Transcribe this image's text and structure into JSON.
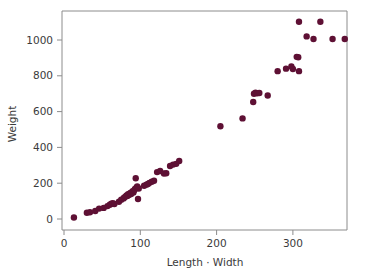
{
  "chart_data": {
    "type": "scatter",
    "title": "",
    "xlabel": "Length · Width",
    "ylabel": "Weight",
    "xlim": [
      0,
      375
    ],
    "ylim": [
      0,
      1130
    ],
    "xticks": [
      0,
      100,
      200,
      300
    ],
    "yticks": [
      0,
      200,
      400,
      600,
      800,
      1000
    ],
    "xticklabels": [
      "0",
      "100",
      "200",
      "300"
    ],
    "yticklabels": [
      "0",
      "200",
      "400",
      "600",
      "800",
      "1000"
    ],
    "grid": false,
    "legend": null,
    "marker": {
      "shape": "circle",
      "color": "#5E1034",
      "size": 3.2
    },
    "frame_color": "#8c8c8c",
    "background": "#ffffff",
    "points": [
      {
        "x": 13,
        "y": 8
      },
      {
        "x": 30,
        "y": 35
      },
      {
        "x": 34,
        "y": 38
      },
      {
        "x": 41,
        "y": 45
      },
      {
        "x": 46,
        "y": 58
      },
      {
        "x": 52,
        "y": 62
      },
      {
        "x": 57,
        "y": 72
      },
      {
        "x": 60,
        "y": 80
      },
      {
        "x": 62,
        "y": 85
      },
      {
        "x": 64,
        "y": 88
      },
      {
        "x": 66,
        "y": 84
      },
      {
        "x": 72,
        "y": 96
      },
      {
        "x": 75,
        "y": 108
      },
      {
        "x": 78,
        "y": 115
      },
      {
        "x": 79,
        "y": 120
      },
      {
        "x": 81,
        "y": 126
      },
      {
        "x": 82,
        "y": 132
      },
      {
        "x": 83,
        "y": 129
      },
      {
        "x": 84,
        "y": 138
      },
      {
        "x": 85,
        "y": 134
      },
      {
        "x": 86,
        "y": 142
      },
      {
        "x": 87,
        "y": 146
      },
      {
        "x": 88,
        "y": 139
      },
      {
        "x": 89,
        "y": 150
      },
      {
        "x": 90,
        "y": 155
      },
      {
        "x": 91,
        "y": 148
      },
      {
        "x": 92,
        "y": 160
      },
      {
        "x": 93,
        "y": 168
      },
      {
        "x": 94,
        "y": 228
      },
      {
        "x": 95,
        "y": 176
      },
      {
        "x": 96,
        "y": 182
      },
      {
        "x": 97,
        "y": 112
      },
      {
        "x": 98,
        "y": 170
      },
      {
        "x": 105,
        "y": 186
      },
      {
        "x": 108,
        "y": 192
      },
      {
        "x": 110,
        "y": 196
      },
      {
        "x": 112,
        "y": 202
      },
      {
        "x": 115,
        "y": 208
      },
      {
        "x": 118,
        "y": 214
      },
      {
        "x": 122,
        "y": 262
      },
      {
        "x": 126,
        "y": 268
      },
      {
        "x": 131,
        "y": 254
      },
      {
        "x": 134,
        "y": 256
      },
      {
        "x": 139,
        "y": 296
      },
      {
        "x": 143,
        "y": 304
      },
      {
        "x": 147,
        "y": 308
      },
      {
        "x": 151,
        "y": 324
      },
      {
        "x": 205,
        "y": 518
      },
      {
        "x": 234,
        "y": 562
      },
      {
        "x": 248,
        "y": 654
      },
      {
        "x": 249,
        "y": 700
      },
      {
        "x": 251,
        "y": 706
      },
      {
        "x": 253,
        "y": 702
      },
      {
        "x": 256,
        "y": 704
      },
      {
        "x": 267,
        "y": 690
      },
      {
        "x": 280,
        "y": 826
      },
      {
        "x": 291,
        "y": 840
      },
      {
        "x": 298,
        "y": 852
      },
      {
        "x": 300,
        "y": 838
      },
      {
        "x": 305,
        "y": 906
      },
      {
        "x": 307,
        "y": 904
      },
      {
        "x": 308,
        "y": 826
      },
      {
        "x": 308,
        "y": 1102
      },
      {
        "x": 318,
        "y": 1020
      },
      {
        "x": 327,
        "y": 1006
      },
      {
        "x": 336,
        "y": 1102
      },
      {
        "x": 352,
        "y": 1006
      },
      {
        "x": 368,
        "y": 1006
      }
    ]
  }
}
